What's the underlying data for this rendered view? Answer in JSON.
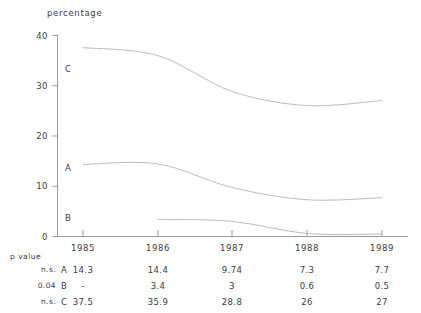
{
  "chart_data": {
    "type": "line",
    "title": "",
    "ylabel": "percentage",
    "xlabel": "",
    "categories": [
      "1985",
      "1986",
      "1987",
      "1988",
      "1989"
    ],
    "ylim": [
      0,
      40
    ],
    "yticks": [
      0,
      10,
      20,
      30,
      40
    ],
    "grid": false,
    "legend": "inline-series-labels",
    "series": [
      {
        "name": "A",
        "p_value": "n.s.",
        "values": [
          14.3,
          14.4,
          9.74,
          7.3,
          7.7
        ],
        "labels": [
          "14.3",
          "14.4",
          "9.74",
          "7.3",
          "7.7"
        ]
      },
      {
        "name": "B",
        "p_value": "0.04",
        "values": [
          null,
          3.4,
          3,
          0.6,
          0.5
        ],
        "labels": [
          "-",
          "3.4",
          "3",
          "0.6",
          "0.5"
        ]
      },
      {
        "name": "C",
        "p_value": "n.s.",
        "values": [
          37.5,
          35.9,
          28.8,
          26,
          27
        ],
        "labels": [
          "37.5",
          "35.9",
          "28.8",
          "26",
          "27"
        ]
      }
    ],
    "table_header": "p value",
    "line_color": "#b9b9b9",
    "axis_color": "#9a9a9a",
    "text_color": "#3c3c3c"
  },
  "axis": {
    "y_title": "percentage",
    "yticks": [
      "40",
      "30",
      "20",
      "10",
      "0"
    ],
    "xticks": [
      "1985",
      "1986",
      "1987",
      "1988",
      "1989"
    ]
  },
  "series_labels": {
    "c": "C",
    "a": "A",
    "b": "B"
  },
  "table": {
    "header": "p value",
    "rows": [
      {
        "p": "n.s.",
        "key": "A",
        "v1": "14.3",
        "v2": "14.4",
        "v3": "9.74",
        "v4": "7.3",
        "v5": "7.7"
      },
      {
        "p": "0.04",
        "key": "B",
        "v1": "-",
        "v2": "3.4",
        "v3": "3",
        "v4": "0.6",
        "v5": "0.5"
      },
      {
        "p": "n.s.",
        "key": "C",
        "v1": "37.5",
        "v2": "35.9",
        "v3": "28.8",
        "v4": "26",
        "v5": "27"
      }
    ]
  }
}
